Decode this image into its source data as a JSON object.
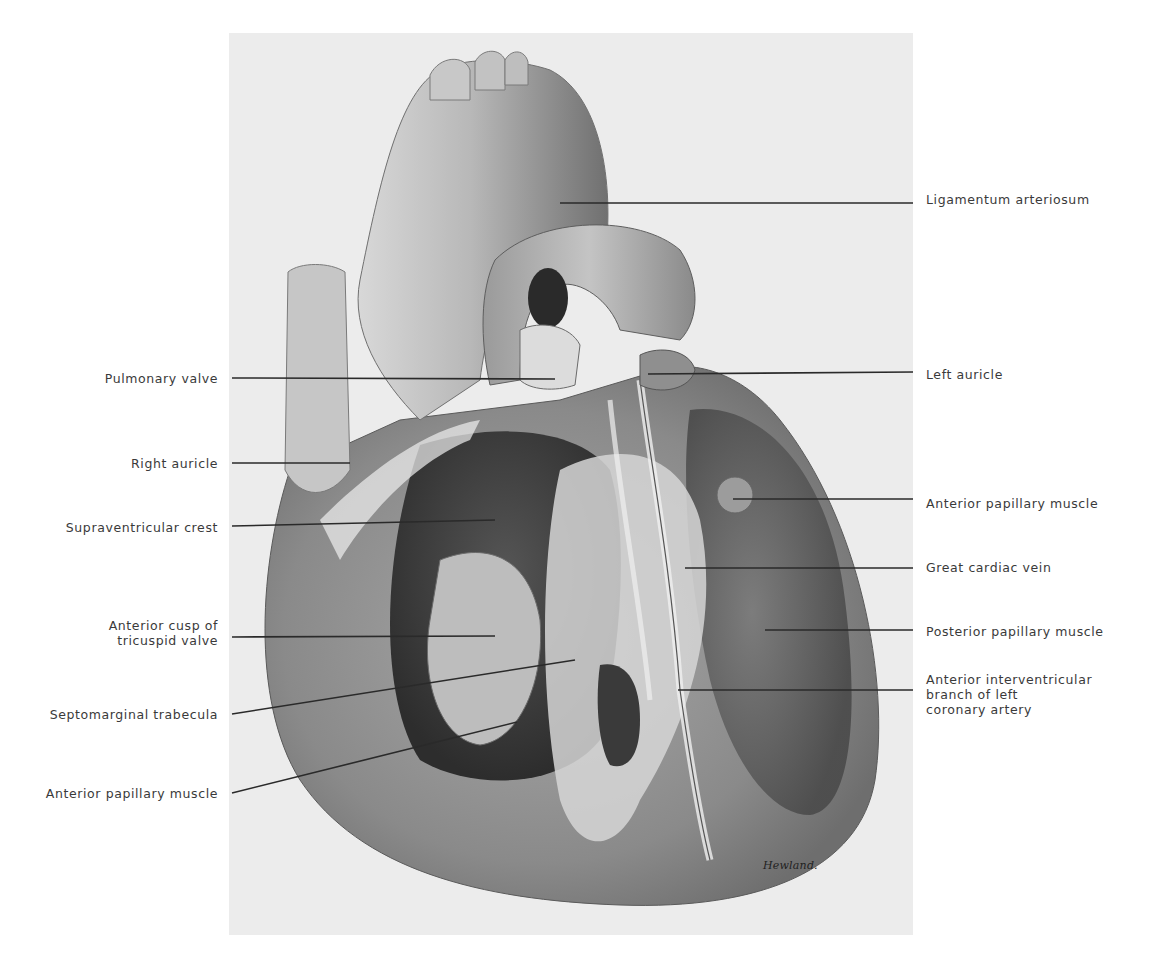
{
  "figure": {
    "signature": "Hewland.",
    "colors": {
      "background": "#ffffff",
      "plate": "#ececec",
      "label_text": "#3a3a3a",
      "leader_line": "#2a2a2a"
    }
  },
  "labels_left": [
    {
      "id": "pulmonary-valve",
      "text": "Pulmonary valve",
      "x_right": 218,
      "y": 371,
      "line": [
        232,
        378,
        555,
        379
      ]
    },
    {
      "id": "right-auricle",
      "text": "Right auricle",
      "x_right": 218,
      "y": 456,
      "line": [
        232,
        463,
        350,
        463
      ]
    },
    {
      "id": "supraventricular-crest",
      "text": "Supraventricular crest",
      "x_right": 218,
      "y": 520,
      "line": [
        232,
        526,
        495,
        520
      ]
    },
    {
      "id": "anterior-cusp-tricuspid",
      "text": "Anterior cusp of\ntricuspid valve",
      "x_right": 218,
      "y": 618,
      "line": [
        232,
        637,
        495,
        636
      ]
    },
    {
      "id": "septomarginal-trabecula",
      "text": "Septomarginal trabecula",
      "x_right": 218,
      "y": 707,
      "line": [
        232,
        714,
        575,
        660
      ]
    },
    {
      "id": "anterior-papillary-muscle-left",
      "text": "Anterior papillary muscle",
      "x_right": 218,
      "y": 786,
      "line": [
        232,
        793,
        517,
        722
      ]
    }
  ],
  "labels_right": [
    {
      "id": "ligamentum-arteriosum",
      "text": "Ligamentum arteriosum",
      "x_left": 926,
      "y": 192,
      "line": [
        560,
        203,
        913,
        203
      ]
    },
    {
      "id": "left-auricle",
      "text": "Left auricle",
      "x_left": 926,
      "y": 367,
      "line": [
        648,
        374,
        913,
        372
      ]
    },
    {
      "id": "anterior-papillary-muscle-right",
      "text": "Anterior papillary muscle",
      "x_left": 926,
      "y": 496,
      "line": [
        733,
        499,
        913,
        499
      ]
    },
    {
      "id": "great-cardiac-vein",
      "text": "Great cardiac vein",
      "x_left": 926,
      "y": 560,
      "line": [
        685,
        568,
        913,
        568
      ]
    },
    {
      "id": "posterior-papillary-muscle",
      "text": "Posterior papillary muscle",
      "x_left": 926,
      "y": 624,
      "line": [
        765,
        630,
        913,
        630
      ]
    },
    {
      "id": "anterior-interventricular-branch",
      "text": "Anterior interventricular\nbranch of left\ncoronary artery",
      "x_left": 926,
      "y": 672,
      "line": [
        678,
        690,
        913,
        690
      ]
    }
  ]
}
